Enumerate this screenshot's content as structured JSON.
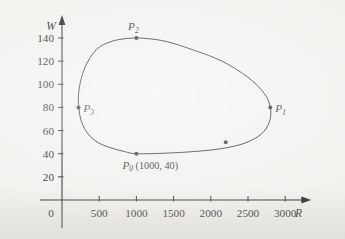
{
  "figure": {
    "name": "predator-prey-phase-plane",
    "background_color": "#f2f1ee",
    "ink_color": "#2b2b2b"
  },
  "chart_data": {
    "type": "line",
    "title": "",
    "xlabel": "R",
    "ylabel": "W",
    "xlim": [
      0,
      3250
    ],
    "ylim": [
      0,
      152
    ],
    "grid": false,
    "legend": null,
    "xticks": [
      500,
      1000,
      1500,
      2000,
      2500,
      3000
    ],
    "xticklabels": [
      "500",
      "1000",
      "1500",
      "2000",
      "2500",
      "3000"
    ],
    "yticks": [
      0,
      20,
      40,
      60,
      80,
      100,
      120,
      140
    ],
    "yticklabels": [
      "0",
      "20",
      "40",
      "60",
      "80",
      "100",
      "120",
      "140"
    ],
    "origin_label": "0",
    "series": [
      {
        "name": "phase-trajectory",
        "closed": true,
        "style": "solid",
        "x": [
          1000,
          1400,
          1800,
          2150,
          2450,
          2680,
          2790,
          2800,
          2720,
          2500,
          2150,
          1750,
          1400,
          1150,
          960,
          800,
          640,
          480,
          350,
          262,
          222,
          226,
          250,
          300,
          380,
          500,
          660,
          830,
          1000
        ],
        "y": [
          40,
          40.5,
          42,
          44.5,
          49,
          57,
          68,
          80,
          92,
          106,
          120,
          130,
          137,
          139.5,
          140,
          139,
          136.5,
          131,
          120,
          106,
          91,
          80,
          70,
          62,
          55,
          49,
          45,
          42,
          40
        ]
      }
    ],
    "points": [
      {
        "id": "P0",
        "label": "P",
        "sub": "0",
        "coords_text": "(1000, 40)",
        "x": 1000,
        "y": 40,
        "label_position": "below"
      },
      {
        "id": "P1",
        "label": "P",
        "sub": "1",
        "coords_text": "",
        "x": 2800,
        "y": 80,
        "label_position": "right"
      },
      {
        "id": "P2",
        "label": "P",
        "sub": "2",
        "coords_text": "",
        "x": 1000,
        "y": 140,
        "label_position": "above"
      },
      {
        "id": "P3",
        "label": "P",
        "sub": "3",
        "coords_text": "",
        "x": 222,
        "y": 80,
        "label_position": "right"
      },
      {
        "id": "Pu",
        "label": "",
        "sub": "",
        "coords_text": "",
        "x": 2200,
        "y": 50,
        "label_position": "none"
      }
    ]
  }
}
